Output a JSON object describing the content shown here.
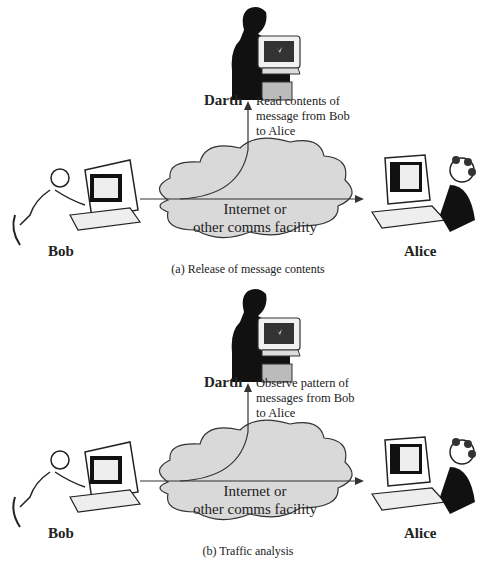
{
  "panels": [
    {
      "id": "a",
      "caption": "(a) Release of message contents",
      "attacker": {
        "name": "Darth",
        "annotation_lines": [
          "Read contents of",
          "message from Bob",
          "to Alice"
        ]
      },
      "sender": {
        "name": "Bob"
      },
      "receiver": {
        "name": "Alice"
      },
      "network": {
        "lines": [
          "Internet or",
          "other comms facility"
        ]
      }
    },
    {
      "id": "b",
      "caption": "(b) Traffic analysis",
      "attacker": {
        "name": "Darth",
        "annotation_lines": [
          "Observe pattern of",
          "messages from Bob",
          "to Alice"
        ]
      },
      "sender": {
        "name": "Bob"
      },
      "receiver": {
        "name": "Alice"
      },
      "network": {
        "lines": [
          "Internet or",
          "other comms facility"
        ]
      }
    }
  ],
  "colors": {
    "cloud_fill": "#d9d9d9",
    "line": "#333333",
    "silhouette": "#111111"
  }
}
